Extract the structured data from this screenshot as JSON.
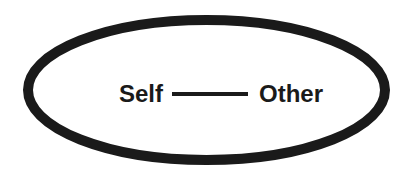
{
  "diagram": {
    "nodes": [
      {
        "id": "self",
        "label": "Self"
      },
      {
        "id": "other",
        "label": "Other"
      }
    ],
    "edges": [
      {
        "from": "self",
        "to": "other",
        "style": "solid-line"
      }
    ],
    "container": {
      "shape": "ellipse",
      "stroke_color": "#1a1a1a"
    }
  },
  "colors": {
    "stroke": "#1a1a1a",
    "text": "#1a1a1a",
    "background": "#ffffff"
  }
}
